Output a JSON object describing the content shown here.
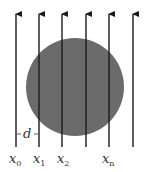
{
  "diagram": {
    "type": "parallel rays through a disk",
    "colors": {
      "disk_fill": "#6b6b6b",
      "line": "#1a1a1a",
      "background": "#ffffff"
    },
    "disk": {
      "cx": 75,
      "cy": 87,
      "r": 49
    },
    "rays": [
      {
        "x": 16,
        "label": "x",
        "sub": "0"
      },
      {
        "x": 39,
        "label": "x",
        "sub": "1"
      },
      {
        "x": 62,
        "label": "x",
        "sub": "2"
      },
      {
        "x": 86,
        "label": "",
        "sub": ""
      },
      {
        "x": 109,
        "label": "x",
        "sub": "n"
      },
      {
        "x": 133,
        "label": "",
        "sub": ""
      }
    ],
    "spacing_label": "d",
    "ray_top": 13,
    "ray_bottom": 147
  }
}
